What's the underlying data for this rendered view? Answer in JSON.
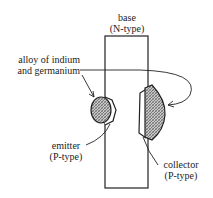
{
  "diagram": {
    "type": "alloy-junction transistor cross-section",
    "labels": {
      "base_line1": "base",
      "base_line2": "(N-type)",
      "alloy_line1": "alloy of indium",
      "alloy_line2": "and germanium",
      "emitter_line1": "emitter",
      "emitter_line2": "(P-type)",
      "collector_line1": "collector",
      "collector_line2": "(P-type)"
    },
    "colors": {
      "line": "#222222",
      "hatch": "#888888",
      "background": "#ffffff"
    }
  }
}
